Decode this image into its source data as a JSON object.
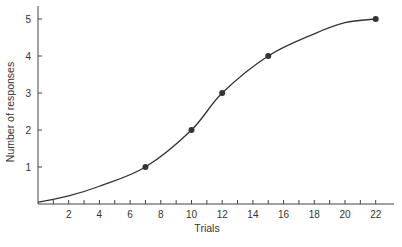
{
  "chart_data": {
    "type": "line",
    "title": "",
    "xlabel": "Trials",
    "ylabel": "Number of responses",
    "xlim": [
      0,
      23
    ],
    "ylim": [
      0,
      5.3
    ],
    "x_ticks": [
      1,
      2,
      3,
      4,
      5,
      6,
      7,
      8,
      9,
      10,
      11,
      12,
      13,
      14,
      15,
      16,
      17,
      18,
      19,
      20,
      21,
      22
    ],
    "x_tick_labels": [
      "2",
      "4",
      "6",
      "8",
      "10",
      "12",
      "14",
      "16",
      "18",
      "20",
      "22"
    ],
    "x_tick_label_values": [
      2,
      4,
      6,
      8,
      10,
      12,
      14,
      16,
      18,
      20,
      22
    ],
    "y_ticks": [
      1,
      2,
      3,
      4,
      5
    ],
    "y_tick_labels": [
      "1",
      "2",
      "3",
      "4",
      "5"
    ],
    "grid": false,
    "legend": null,
    "series": [
      {
        "name": "Cumulative responses",
        "marker_points": {
          "x": [
            7,
            10,
            12,
            15,
            22
          ],
          "y": [
            1,
            2,
            3,
            4,
            5
          ]
        },
        "curve": {
          "x": [
            0,
            2,
            4,
            7,
            10,
            12,
            15,
            18,
            20,
            22
          ],
          "y": [
            0.05,
            0.22,
            0.48,
            1.0,
            2.0,
            3.0,
            4.0,
            4.6,
            4.9,
            5.0
          ]
        },
        "color": "#333333"
      }
    ]
  }
}
